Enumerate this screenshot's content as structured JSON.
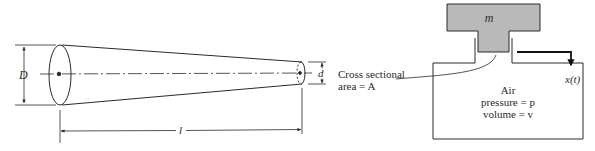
{
  "colors": {
    "ink": "#2a2a2a",
    "mass_fill": "#b9b9b9",
    "background": "#ffffff"
  },
  "cone": {
    "large_diameter_label": "D",
    "small_diameter_label": "d",
    "length_label": "l"
  },
  "leader": {
    "line1": "Cross sectional",
    "line2": "area = A"
  },
  "piston": {
    "mass_label": "m",
    "displacement_label": "x(t)",
    "chamber": {
      "line1": "Air",
      "line2": "pressure = p",
      "line3": "volume = v"
    }
  }
}
